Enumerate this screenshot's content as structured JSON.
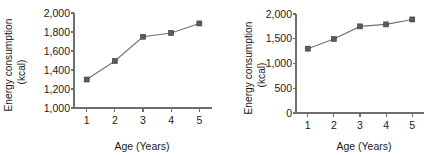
{
  "figure": {
    "panels": [
      {
        "id": "left",
        "chart_data": {
          "type": "line",
          "title": "",
          "xlabel": "Age (Years)",
          "ylabel": "Energy consumption (kcal)",
          "ylabel_line1": "Energy consumption",
          "ylabel_line2": "(kcal)",
          "x": [
            1,
            2,
            3,
            4,
            5
          ],
          "categories": [
            "1",
            "2",
            "3",
            "4",
            "5"
          ],
          "values": [
            1300,
            1495,
            1750,
            1790,
            1890
          ],
          "series": [
            {
              "name": "Energy consumption",
              "values": [
                1300,
                1495,
                1750,
                1790,
                1890
              ]
            }
          ],
          "xlim": [
            0.55,
            5.45
          ],
          "ylim": [
            1000,
            2000
          ],
          "xticks": [
            1,
            2,
            3,
            4,
            5
          ],
          "xticklabels": [
            "1",
            "2",
            "3",
            "4",
            "5"
          ],
          "yticks": [
            1000,
            1200,
            1400,
            1600,
            1800,
            2000
          ],
          "yticklabels": [
            "1,000",
            "1,200",
            "1,400",
            "1,600",
            "1,800",
            "2,000"
          ],
          "grid": false,
          "legend": "none",
          "marker": "square",
          "line_color": "#717171",
          "marker_color": "#5a5a5a",
          "axis_color": "#6f6f6f"
        }
      },
      {
        "id": "right",
        "chart_data": {
          "type": "line",
          "title": "",
          "xlabel": "Age (Years)",
          "ylabel": "Energy consumption (kcal)",
          "ylabel_line1": "Energy consumption",
          "ylabel_line2": "(kcal)",
          "x": [
            1,
            2,
            3,
            4,
            5
          ],
          "categories": [
            "1",
            "2",
            "3",
            "4",
            "5"
          ],
          "values": [
            1300,
            1495,
            1750,
            1790,
            1890
          ],
          "series": [
            {
              "name": "Energy consumption",
              "values": [
                1300,
                1495,
                1750,
                1790,
                1890
              ]
            }
          ],
          "xlim": [
            0.55,
            5.45
          ],
          "ylim": [
            0,
            2000
          ],
          "xticks": [
            1,
            2,
            3,
            4,
            5
          ],
          "xticklabels": [
            "1",
            "2",
            "3",
            "4",
            "5"
          ],
          "yticks": [
            0,
            500,
            1000,
            1500,
            2000
          ],
          "yticklabels": [
            "0",
            "500",
            "1,000",
            "1,500",
            "2,000"
          ],
          "grid": false,
          "legend": "none",
          "marker": "square",
          "line_color": "#717171",
          "marker_color": "#5a5a5a",
          "axis_color": "#6f6f6f"
        }
      }
    ]
  }
}
